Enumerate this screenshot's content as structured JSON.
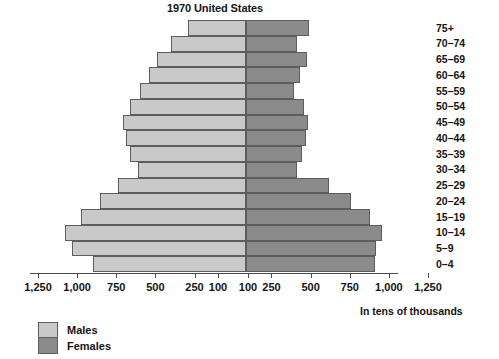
{
  "chart_data": {
    "type": "bar",
    "subtype": "population-pyramid",
    "title": "1970 United States",
    "xlabel": "In tens of thousands",
    "ylabel": "",
    "categories": [
      "75+",
      "70–74",
      "65–69",
      "60–64",
      "55–59",
      "50–54",
      "45–49",
      "40–44",
      "35–39",
      "30–34",
      "25–29",
      "20–24",
      "15–19",
      "10–14",
      "5–9",
      "0–4"
    ],
    "series": [
      {
        "name": "Males",
        "side": "left",
        "color": "#c9c9c9",
        "values": [
          290,
          400,
          490,
          540,
          600,
          660,
          710,
          690,
          660,
          610,
          740,
          855,
          975,
          1080,
          1030,
          900
        ]
      },
      {
        "name": "Females",
        "side": "right",
        "color": "#8b8b8b",
        "values": [
          490,
          410,
          480,
          435,
          395,
          455,
          485,
          470,
          445,
          415,
          615,
          755,
          880,
          955,
          915,
          910
        ]
      }
    ],
    "xlim": [
      1250,
      1250
    ],
    "x_tick_values": [
      1250,
      1000,
      750,
      500,
      250,
      100
    ],
    "x_tick_labels_left": [
      "1,250",
      "1,000",
      "750",
      "500",
      "250",
      "100"
    ],
    "x_tick_labels_right": [
      "100",
      "250",
      "500",
      "750",
      "1,000",
      "1,250"
    ],
    "grid": false,
    "legend_position": "bottom-left",
    "legend_entries": [
      "Males",
      "Females"
    ],
    "axis_color": "#4a4a4a",
    "bar_border_color": "#5d5d5d",
    "background": "#ffffff"
  },
  "legend": {
    "males_label": "Males",
    "females_label": "Females"
  },
  "caption": {
    "units": "In tens of thousands"
  }
}
